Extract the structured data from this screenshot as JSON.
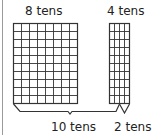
{
  "diagram": {
    "left_block": {
      "label": "8 tens",
      "columns": 8,
      "rows": 10
    },
    "right_block": {
      "label": "4 tens",
      "columns": 4,
      "rows": 10
    },
    "bracket_large": {
      "label": "10 tens",
      "spans_columns": 10
    },
    "bracket_small": {
      "label": "2 tens",
      "spans_columns": 2
    },
    "colors": {
      "grid_line": "#333333",
      "text": "#222222",
      "border": "#9a9a9a"
    }
  }
}
